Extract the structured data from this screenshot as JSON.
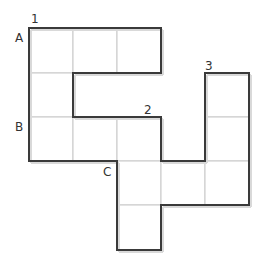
{
  "diagram": {
    "type": "grid-polyomino",
    "cell_size_px": 44,
    "origin_px": [
      29,
      28
    ],
    "columns": 5,
    "rows": 5,
    "colors": {
      "outline": "#3a3a3a",
      "inner_grid": "#c8c8c8",
      "fill": "#ffffff",
      "shadow": "#d9d9d9",
      "label": "#333333"
    },
    "cells": [
      [
        0,
        0
      ],
      [
        1,
        0
      ],
      [
        2,
        0
      ],
      [
        0,
        1
      ],
      [
        4,
        1
      ],
      [
        0,
        2
      ],
      [
        1,
        2
      ],
      [
        2,
        2
      ],
      [
        4,
        2
      ],
      [
        2,
        3
      ],
      [
        3,
        3
      ],
      [
        4,
        3
      ],
      [
        2,
        4
      ]
    ],
    "labels": {
      "n1": "1",
      "n2": "2",
      "n3": "3",
      "a": "A",
      "b": "B",
      "c": "C"
    }
  }
}
